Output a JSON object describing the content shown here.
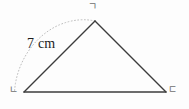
{
  "figure": {
    "type": "triangle-with-compass-arc",
    "background_color": "#fdfdfd",
    "stroke_color": "#3c3c3c",
    "arc_color": "#b9b9b9",
    "label_color": "#6f6f6f",
    "measure_color": "#1c1c1c",
    "vertices": {
      "apex": {
        "label": "ㄱ",
        "x": 95,
        "y": 21
      },
      "bottom_left": {
        "label": "ㄴ",
        "x": 24,
        "y": 92
      },
      "bottom_right": {
        "label": "ㄷ",
        "x": 166,
        "y": 92
      }
    },
    "measurement": {
      "text": "7 cm",
      "value": 7,
      "unit": "cm",
      "measures_side": "ㄴㄱ"
    },
    "arc": {
      "center_x": 24,
      "center_y": 92,
      "radius": 100,
      "start_x": 15,
      "start_y": 91,
      "end_x": 95,
      "end_y": 21,
      "style": "dotted"
    },
    "sides": [
      {
        "name": "ㄴㄱ",
        "from": "bottom_left",
        "to": "apex"
      },
      {
        "name": "ㄱㄷ",
        "from": "apex",
        "to": "bottom_right"
      },
      {
        "name": "ㄴㄷ",
        "from": "bottom_left",
        "to": "bottom_right"
      }
    ]
  }
}
